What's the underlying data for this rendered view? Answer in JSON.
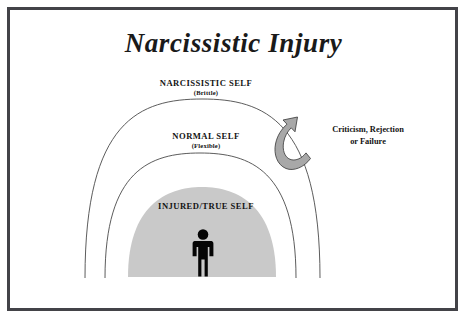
{
  "figure": {
    "title": "Narcissistic Injury",
    "background_color": "#ffffff",
    "frame_color": "#434348",
    "text_color": "#131313",
    "dome_fill_color": "#c9c9c9",
    "arrow_fill_color": "#a8a8a8",
    "arc_stroke_color": "#4a4a4a",
    "figure_color": "#000000"
  },
  "layers": [
    {
      "id": "narcissistic-self",
      "label": "NARCISSISTIC SELF",
      "sublabel": "(Brittle)",
      "shape": "outer-arc"
    },
    {
      "id": "normal-self",
      "label": "NORMAL SELF",
      "sublabel": "(Flexible)",
      "shape": "middle-arc"
    },
    {
      "id": "injured-true-self",
      "label": "INJURED/TRUE SELF",
      "sublabel": "",
      "shape": "filled-dome"
    }
  ],
  "annotation": {
    "line1": "Criticism, Rejection",
    "line2": "or Failure",
    "arrow": "curved-hook-arrow-up"
  },
  "person_icon": "standing-person-pictogram"
}
